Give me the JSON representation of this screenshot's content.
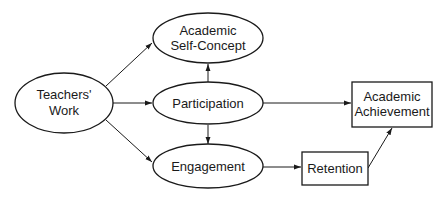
{
  "diagram": {
    "nodes": [
      {
        "id": "teachers_work",
        "shape": "ellipse",
        "lines": [
          "Teachers'",
          "Work"
        ]
      },
      {
        "id": "self_concept",
        "shape": "ellipse",
        "lines": [
          "Academic",
          "Self-Concept"
        ]
      },
      {
        "id": "participation",
        "shape": "ellipse",
        "lines": [
          "Participation"
        ]
      },
      {
        "id": "engagement",
        "shape": "ellipse",
        "lines": [
          "Engagement"
        ]
      },
      {
        "id": "retention",
        "shape": "rectangle",
        "lines": [
          "Retention"
        ]
      },
      {
        "id": "achievement",
        "shape": "rectangle",
        "lines": [
          "Academic",
          "Achievement"
        ]
      }
    ],
    "edges": [
      {
        "from": "teachers_work",
        "to": "self_concept"
      },
      {
        "from": "teachers_work",
        "to": "participation"
      },
      {
        "from": "teachers_work",
        "to": "engagement"
      },
      {
        "from": "participation",
        "to": "self_concept"
      },
      {
        "from": "participation",
        "to": "engagement"
      },
      {
        "from": "participation",
        "to": "achievement"
      },
      {
        "from": "engagement",
        "to": "retention"
      },
      {
        "from": "retention",
        "to": "achievement"
      }
    ]
  }
}
